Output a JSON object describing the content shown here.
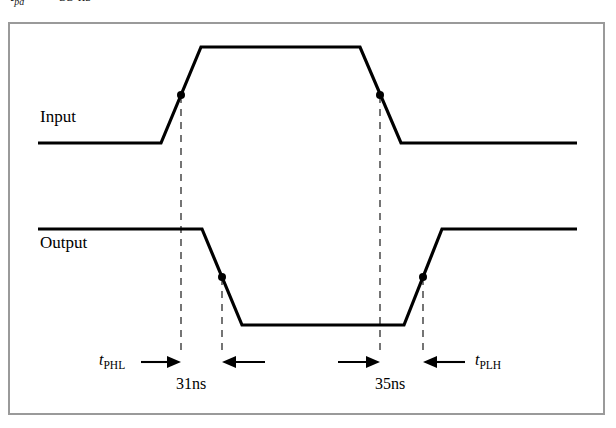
{
  "figure": {
    "type": "timing-diagram",
    "clipped_caption": {
      "prefix": "t",
      "subscript": "pd",
      "equals": "=",
      "value": "33 ns"
    },
    "frame": {
      "border_color": "#9a9a9a",
      "background": "#ffffff"
    }
  },
  "signals": {
    "input": {
      "label": "Input",
      "low_level_text": "low",
      "high_level_text": "high"
    },
    "output": {
      "label": "Output",
      "high_level_text": "high",
      "low_level_text": "low"
    }
  },
  "annotations": {
    "t_phl": {
      "var": "t",
      "sub": "PHL"
    },
    "t_plh": {
      "var": "t",
      "sub": "PLH"
    },
    "measurement_left": "31ns",
    "measurement_right": "35ns"
  },
  "colors": {
    "waveform": "#000000",
    "dashed": "#2b2b2b",
    "border": "#9a9a9a",
    "background": "#ffffff"
  },
  "chart_data": {
    "type": "line",
    "xlabel": "",
    "ylabel": "",
    "grid": false,
    "legend": "none",
    "xlim": [
      0,
      616
    ],
    "ylim": [
      0,
      428
    ],
    "series": [
      {
        "name": "Input",
        "points": [
          [
            38,
            143
          ],
          [
            161,
            143
          ],
          [
            201,
            47
          ],
          [
            360,
            47
          ],
          [
            401,
            143
          ],
          [
            577,
            143
          ]
        ]
      },
      {
        "name": "Output",
        "points": [
          [
            38,
            229
          ],
          [
            202,
            229
          ],
          [
            242,
            325
          ],
          [
            404,
            325
          ],
          [
            442,
            229
          ],
          [
            577,
            229
          ]
        ]
      }
    ],
    "markers": [
      {
        "label": "input-rise-midpoint",
        "x": 181,
        "y": 95
      },
      {
        "label": "input-fall-midpoint",
        "x": 380,
        "y": 95
      },
      {
        "label": "output-fall-midpoint",
        "x": 222,
        "y": 277
      },
      {
        "label": "output-rise-midpoint",
        "x": 423,
        "y": 277
      }
    ],
    "reference_lines": [
      {
        "label": "input-rise-ref",
        "x": 181,
        "y0": 95,
        "y1": 355
      },
      {
        "label": "output-fall-ref",
        "x": 222,
        "y0": 277,
        "y1": 355
      },
      {
        "label": "input-fall-ref",
        "x": 380,
        "y0": 95,
        "y1": 355
      },
      {
        "label": "output-rise-ref",
        "x": 423,
        "y0": 277,
        "y1": 355
      }
    ],
    "measurements": [
      {
        "label": "31ns",
        "from_x": 181,
        "to_x": 222,
        "y": 362,
        "name": "t_PHL"
      },
      {
        "label": "35ns",
        "from_x": 380,
        "to_x": 423,
        "y": 362,
        "name": "t_PLH"
      }
    ]
  }
}
